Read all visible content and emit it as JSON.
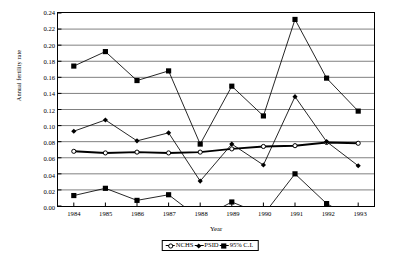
{
  "chart_data": {
    "type": "line",
    "title": "",
    "xlabel": "Year",
    "ylabel": "Annual fertility rate",
    "categories": [
      "1984",
      "1985",
      "1986",
      "1987",
      "1988",
      "1989",
      "1990",
      "1991",
      "1992",
      "1993"
    ],
    "x": [
      1984,
      1985,
      1986,
      1987,
      1988,
      1989,
      1990,
      1991,
      1992,
      1993
    ],
    "xlim": [
      1983.5,
      1993.5
    ],
    "ylim": [
      0.0,
      0.24
    ],
    "ytick_values": [
      0.0,
      0.02,
      0.04,
      0.06,
      0.08,
      0.1,
      0.12,
      0.14,
      0.16,
      0.18,
      0.2,
      0.22,
      0.24
    ],
    "ytick_labels": [
      "0.00",
      "0.02",
      "0.04",
      "0.06",
      "0.08",
      "0.10",
      "0.12",
      "0.14",
      "0.16",
      "0.18",
      "0.20",
      "0.22",
      "0.24"
    ],
    "xtick_labels": [
      "1984",
      "1985",
      "1986",
      "1987",
      "1988",
      "1989",
      "1990",
      "1991",
      "1992",
      "1993"
    ],
    "grid": "horizontal",
    "legend_position": "bottom-center",
    "series": [
      {
        "name": "NCHS",
        "marker": "circle",
        "line_width": "thick",
        "color": "#000000",
        "values": [
          0.068,
          0.066,
          0.067,
          0.066,
          0.067,
          0.071,
          0.074,
          0.075,
          0.079,
          0.078
        ]
      },
      {
        "name": "PSID",
        "marker": "diamond",
        "line_width": "thin",
        "color": "#000000",
        "values": [
          0.093,
          0.107,
          0.081,
          0.091,
          0.031,
          0.077,
          0.051,
          0.136,
          0.08,
          0.05
        ]
      },
      {
        "name": "95% C.I.",
        "marker": "square",
        "line_width": "thin",
        "color": "#000000",
        "bound": "upper",
        "values": [
          0.174,
          0.192,
          0.156,
          0.168,
          0.077,
          0.149,
          0.112,
          0.232,
          0.159,
          0.118
        ]
      },
      {
        "name": "95% C.I.",
        "marker": "square",
        "line_width": "thin",
        "color": "#000000",
        "bound": "lower",
        "values": [
          0.013,
          0.022,
          0.007,
          0.014,
          -0.016,
          0.005,
          -0.011,
          0.04,
          0.003,
          -0.019
        ]
      }
    ]
  },
  "legend": {
    "items": [
      {
        "label": "NCHS",
        "marker": "circle",
        "style": "thick"
      },
      {
        "label": "PSID",
        "marker": "diamond",
        "style": "thin"
      },
      {
        "label": "95% C.I.",
        "marker": "square",
        "style": "thin"
      }
    ]
  },
  "colors": {
    "grid": "#808080",
    "axis": "#000000",
    "series": "#000000",
    "background": "#ffffff"
  }
}
